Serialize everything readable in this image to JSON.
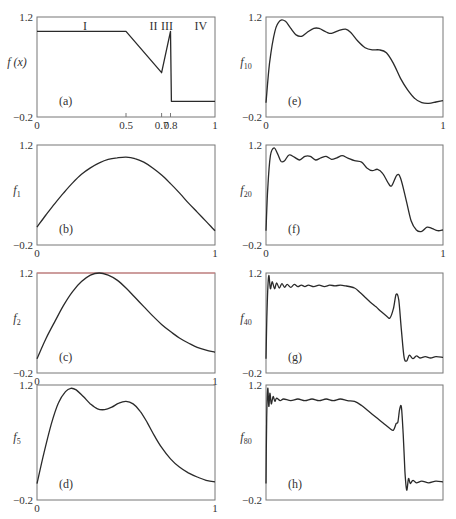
{
  "figure": {
    "y_range": [
      -0.2,
      1.2
    ],
    "x_range": [
      0,
      1
    ],
    "frame_color": "#777777",
    "curve_color": "#2a2a2a"
  },
  "chart_data": [
    {
      "id": "a",
      "type": "line",
      "panel_label": "(a)",
      "ylabel": "f (x)",
      "ylabel_sub": "",
      "yticks": [
        "1.2",
        "-0.2"
      ],
      "xticks": [
        {
          "x": 0,
          "label": "0"
        },
        {
          "x": 0.5,
          "label": "0.5"
        },
        {
          "x": 0.7,
          "label": "0.7"
        },
        {
          "x": 0.75,
          "label": "0.8"
        },
        {
          "x": 1,
          "label": "1"
        }
      ],
      "region_labels": [
        {
          "x": 0.27,
          "label": "I"
        },
        {
          "x": 0.655,
          "label": "II"
        },
        {
          "x": 0.73,
          "label": "III"
        },
        {
          "x": 0.92,
          "label": "IV"
        }
      ],
      "box": {
        "left": 37,
        "top": 17,
        "right": 215,
        "bottom": 117
      },
      "points": [
        [
          0,
          1.0
        ],
        [
          0.5,
          1.0
        ],
        [
          0.7,
          0.42
        ],
        [
          0.75,
          1.0
        ],
        [
          0.755,
          0.02
        ],
        [
          1.0,
          0.02
        ]
      ]
    },
    {
      "id": "b",
      "type": "line",
      "panel_label": "(b)",
      "ylabel": "f",
      "ylabel_sub": "1",
      "yticks": [
        "1.2",
        "-0.2"
      ],
      "xticks": [
        {
          "x": 0,
          "label": "0"
        },
        {
          "x": 1,
          "label": "1"
        }
      ],
      "box": {
        "left": 37,
        "top": 145,
        "right": 215,
        "bottom": 245
      },
      "points": [
        [
          0,
          0.05
        ],
        [
          0.05,
          0.22
        ],
        [
          0.1,
          0.38
        ],
        [
          0.15,
          0.53
        ],
        [
          0.2,
          0.67
        ],
        [
          0.25,
          0.79
        ],
        [
          0.3,
          0.88
        ],
        [
          0.35,
          0.95
        ],
        [
          0.4,
          1.0
        ],
        [
          0.45,
          1.02
        ],
        [
          0.5,
          1.03
        ],
        [
          0.55,
          1.01
        ],
        [
          0.6,
          0.96
        ],
        [
          0.65,
          0.88
        ],
        [
          0.7,
          0.78
        ],
        [
          0.75,
          0.66
        ],
        [
          0.8,
          0.53
        ],
        [
          0.85,
          0.39
        ],
        [
          0.9,
          0.26
        ],
        [
          0.95,
          0.13
        ],
        [
          1.0,
          0.0
        ]
      ]
    },
    {
      "id": "c",
      "type": "line",
      "panel_label": "(c)",
      "ylabel": "f",
      "ylabel_sub": "2",
      "yticks": [
        "1.2",
        "-0.2"
      ],
      "xticks": [
        {
          "x": 0,
          "label": "0"
        },
        {
          "x": 1,
          "label": "1"
        }
      ],
      "box": {
        "left": 37,
        "top": 273,
        "right": 215,
        "bottom": 373
      },
      "top_line_color": "#e08080",
      "points": [
        [
          0,
          0.0
        ],
        [
          0.05,
          0.28
        ],
        [
          0.1,
          0.52
        ],
        [
          0.15,
          0.75
        ],
        [
          0.2,
          0.94
        ],
        [
          0.25,
          1.08
        ],
        [
          0.3,
          1.17
        ],
        [
          0.35,
          1.2
        ],
        [
          0.4,
          1.17
        ],
        [
          0.45,
          1.1
        ],
        [
          0.5,
          0.99
        ],
        [
          0.55,
          0.86
        ],
        [
          0.6,
          0.73
        ],
        [
          0.65,
          0.6
        ],
        [
          0.7,
          0.48
        ],
        [
          0.75,
          0.38
        ],
        [
          0.8,
          0.29
        ],
        [
          0.85,
          0.22
        ],
        [
          0.9,
          0.16
        ],
        [
          0.95,
          0.12
        ],
        [
          1.0,
          0.09
        ]
      ]
    },
    {
      "id": "d",
      "type": "line",
      "panel_label": "(d)",
      "ylabel": "f",
      "ylabel_sub": "5",
      "yticks": [
        "1.2",
        "-0.2"
      ],
      "xticks": [
        {
          "x": 0,
          "label": "0"
        },
        {
          "x": 1,
          "label": "1"
        }
      ],
      "box": {
        "left": 37,
        "top": 385,
        "right": 215,
        "bottom": 500
      },
      "points": [
        [
          0,
          0.0
        ],
        [
          0.04,
          0.38
        ],
        [
          0.08,
          0.72
        ],
        [
          0.12,
          0.98
        ],
        [
          0.16,
          1.12
        ],
        [
          0.19,
          1.16
        ],
        [
          0.22,
          1.14
        ],
        [
          0.26,
          1.06
        ],
        [
          0.3,
          0.97
        ],
        [
          0.34,
          0.91
        ],
        [
          0.38,
          0.9
        ],
        [
          0.42,
          0.93
        ],
        [
          0.46,
          0.98
        ],
        [
          0.5,
          1.0
        ],
        [
          0.54,
          0.97
        ],
        [
          0.58,
          0.88
        ],
        [
          0.62,
          0.74
        ],
        [
          0.66,
          0.58
        ],
        [
          0.7,
          0.44
        ],
        [
          0.75,
          0.3
        ],
        [
          0.8,
          0.2
        ],
        [
          0.85,
          0.13
        ],
        [
          0.9,
          0.08
        ],
        [
          0.95,
          0.04
        ],
        [
          1.0,
          0.02
        ]
      ]
    },
    {
      "id": "e",
      "type": "line",
      "panel_label": "(e)",
      "ylabel": "f",
      "ylabel_sub": "10",
      "yticks": [
        "1.2",
        "-0.2"
      ],
      "xticks": [
        {
          "x": 0,
          "label": "0"
        },
        {
          "x": 1,
          "label": "1"
        }
      ],
      "box": {
        "left": 266,
        "top": 17,
        "right": 443,
        "bottom": 117
      },
      "points": [
        [
          0,
          0.0
        ],
        [
          0.02,
          0.55
        ],
        [
          0.05,
          1.0
        ],
        [
          0.08,
          1.15
        ],
        [
          0.11,
          1.14
        ],
        [
          0.14,
          1.04
        ],
        [
          0.17,
          0.95
        ],
        [
          0.2,
          0.93
        ],
        [
          0.23,
          0.98
        ],
        [
          0.27,
          1.04
        ],
        [
          0.3,
          1.04
        ],
        [
          0.34,
          0.99
        ],
        [
          0.37,
          0.97
        ],
        [
          0.41,
          1.01
        ],
        [
          0.45,
          1.03
        ],
        [
          0.48,
          0.98
        ],
        [
          0.52,
          0.86
        ],
        [
          0.56,
          0.77
        ],
        [
          0.6,
          0.74
        ],
        [
          0.64,
          0.74
        ],
        [
          0.68,
          0.7
        ],
        [
          0.72,
          0.55
        ],
        [
          0.76,
          0.34
        ],
        [
          0.8,
          0.18
        ],
        [
          0.84,
          0.06
        ],
        [
          0.88,
          0.0
        ],
        [
          0.92,
          -0.01
        ],
        [
          0.96,
          0.01
        ],
        [
          1.0,
          0.03
        ]
      ]
    },
    {
      "id": "f",
      "type": "line",
      "panel_label": "(f)",
      "ylabel": "f",
      "ylabel_sub": "20",
      "yticks": [
        "1.2",
        "-0.2"
      ],
      "xticks": [
        {
          "x": 0,
          "label": "0"
        },
        {
          "x": 1,
          "label": "1"
        }
      ],
      "box": {
        "left": 266,
        "top": 145,
        "right": 443,
        "bottom": 245
      },
      "points": [
        [
          0,
          0.0
        ],
        [
          0.01,
          0.6
        ],
        [
          0.025,
          1.05
        ],
        [
          0.045,
          1.16
        ],
        [
          0.065,
          1.08
        ],
        [
          0.085,
          0.97
        ],
        [
          0.105,
          0.98
        ],
        [
          0.13,
          1.06
        ],
        [
          0.16,
          1.03
        ],
        [
          0.19,
          0.99
        ],
        [
          0.22,
          1.04
        ],
        [
          0.25,
          1.04
        ],
        [
          0.28,
          0.99
        ],
        [
          0.31,
          1.02
        ],
        [
          0.34,
          1.04
        ],
        [
          0.37,
          1.0
        ],
        [
          0.4,
          1.02
        ],
        [
          0.43,
          1.05
        ],
        [
          0.46,
          1.02
        ],
        [
          0.5,
          0.98
        ],
        [
          0.54,
          0.96
        ],
        [
          0.57,
          0.88
        ],
        [
          0.6,
          0.84
        ],
        [
          0.63,
          0.86
        ],
        [
          0.66,
          0.8
        ],
        [
          0.69,
          0.67
        ],
        [
          0.71,
          0.63
        ],
        [
          0.74,
          0.78
        ],
        [
          0.76,
          0.74
        ],
        [
          0.79,
          0.45
        ],
        [
          0.82,
          0.14
        ],
        [
          0.85,
          0.01
        ],
        [
          0.88,
          -0.01
        ],
        [
          0.91,
          0.05
        ],
        [
          0.94,
          0.03
        ],
        [
          0.97,
          0.0
        ],
        [
          1.0,
          0.01
        ]
      ]
    },
    {
      "id": "g",
      "type": "line",
      "panel_label": "(g)",
      "ylabel": "f",
      "ylabel_sub": "40",
      "yticks": [
        "1.2",
        "-0.2"
      ],
      "xticks": [],
      "box": {
        "left": 266,
        "top": 273,
        "right": 443,
        "bottom": 373
      },
      "points": [
        [
          0,
          0.0
        ],
        [
          0.006,
          0.7
        ],
        [
          0.015,
          1.16
        ],
        [
          0.025,
          0.98
        ],
        [
          0.035,
          1.08
        ],
        [
          0.048,
          0.98
        ],
        [
          0.06,
          1.06
        ],
        [
          0.075,
          0.99
        ],
        [
          0.09,
          1.05
        ],
        [
          0.105,
          1.0
        ],
        [
          0.12,
          1.04
        ],
        [
          0.14,
          1.0
        ],
        [
          0.16,
          1.04
        ],
        [
          0.18,
          1.01
        ],
        [
          0.2,
          1.03
        ],
        [
          0.22,
          1.01
        ],
        [
          0.24,
          1.03
        ],
        [
          0.27,
          1.01
        ],
        [
          0.3,
          1.03
        ],
        [
          0.33,
          1.01
        ],
        [
          0.36,
          1.03
        ],
        [
          0.39,
          1.02
        ],
        [
          0.42,
          1.03
        ],
        [
          0.45,
          1.02
        ],
        [
          0.5,
          0.99
        ],
        [
          0.53,
          0.93
        ],
        [
          0.56,
          0.86
        ],
        [
          0.59,
          0.79
        ],
        [
          0.62,
          0.73
        ],
        [
          0.65,
          0.66
        ],
        [
          0.68,
          0.6
        ],
        [
          0.7,
          0.57
        ],
        [
          0.72,
          0.7
        ],
        [
          0.735,
          0.9
        ],
        [
          0.75,
          0.82
        ],
        [
          0.765,
          0.4
        ],
        [
          0.78,
          0.02
        ],
        [
          0.795,
          -0.03
        ],
        [
          0.81,
          0.05
        ],
        [
          0.83,
          0.0
        ],
        [
          0.85,
          0.04
        ],
        [
          0.87,
          0.01
        ],
        [
          0.9,
          0.03
        ],
        [
          0.93,
          0.01
        ],
        [
          0.96,
          0.03
        ],
        [
          1.0,
          0.02
        ]
      ]
    },
    {
      "id": "h",
      "type": "line",
      "panel_label": "(h)",
      "ylabel": "f",
      "ylabel_sub": "80",
      "yticks": [
        "1.2",
        "-0.2"
      ],
      "xticks": [],
      "box": {
        "left": 266,
        "top": 385,
        "right": 443,
        "bottom": 500
      },
      "points": [
        [
          0,
          0.0
        ],
        [
          0.004,
          0.8
        ],
        [
          0.01,
          1.16
        ],
        [
          0.016,
          0.94
        ],
        [
          0.022,
          1.1
        ],
        [
          0.03,
          0.97
        ],
        [
          0.04,
          1.06
        ],
        [
          0.05,
          1.0
        ],
        [
          0.06,
          1.04
        ],
        [
          0.08,
          1.01
        ],
        [
          0.1,
          1.03
        ],
        [
          0.14,
          1.01
        ],
        [
          0.18,
          1.03
        ],
        [
          0.22,
          1.01
        ],
        [
          0.26,
          1.03
        ],
        [
          0.3,
          1.01
        ],
        [
          0.34,
          1.03
        ],
        [
          0.38,
          1.01
        ],
        [
          0.42,
          1.03
        ],
        [
          0.46,
          1.01
        ],
        [
          0.5,
          1.0
        ],
        [
          0.54,
          0.95
        ],
        [
          0.58,
          0.88
        ],
        [
          0.62,
          0.81
        ],
        [
          0.66,
          0.74
        ],
        [
          0.7,
          0.67
        ],
        [
          0.72,
          0.65
        ],
        [
          0.735,
          0.73
        ],
        [
          0.745,
          0.75
        ],
        [
          0.755,
          0.9
        ],
        [
          0.765,
          0.93
        ],
        [
          0.775,
          0.6
        ],
        [
          0.785,
          0.15
        ],
        [
          0.795,
          -0.08
        ],
        [
          0.805,
          0.06
        ],
        [
          0.815,
          0.0
        ],
        [
          0.83,
          0.04
        ],
        [
          0.85,
          0.01
        ],
        [
          0.88,
          0.03
        ],
        [
          0.92,
          0.01
        ],
        [
          0.96,
          0.03
        ],
        [
          1.0,
          0.02
        ]
      ]
    }
  ]
}
